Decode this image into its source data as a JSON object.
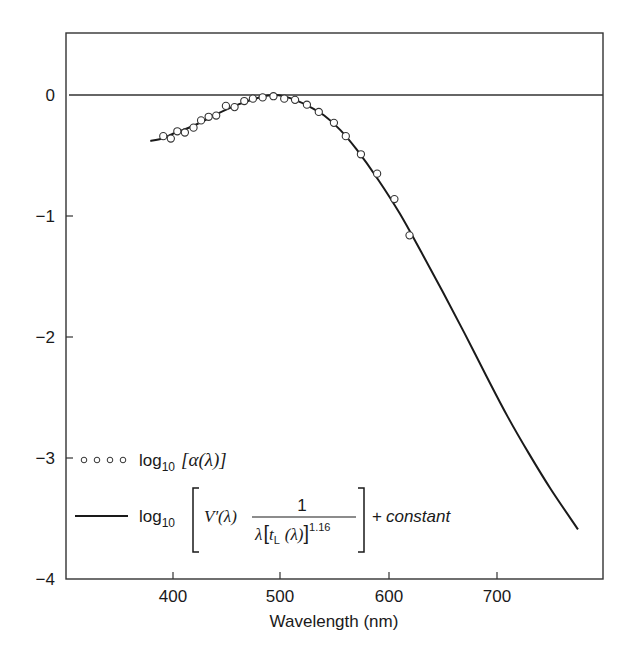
{
  "chart_data": {
    "type": "line",
    "title": "",
    "xlabel": "Wavelength (nm)",
    "ylabel": "",
    "xlim": [
      300,
      800
    ],
    "ylim": [
      -4,
      0.5
    ],
    "grid": false,
    "x_ticks": [
      400,
      500,
      600,
      700
    ],
    "y_ticks": [
      0,
      -1,
      -2,
      -3,
      -4
    ],
    "x_tick_labels": [
      "400",
      "500",
      "600",
      "700"
    ],
    "y_tick_labels": [
      "0",
      "−1",
      "−2",
      "−3",
      "−4"
    ],
    "reference_line": {
      "y": 0
    },
    "legend_position": "lower-left inside",
    "series": [
      {
        "name": "log10 [α(λ)]",
        "style": "open circles",
        "x": [
          391,
          398,
          404,
          411,
          419,
          426,
          433,
          440,
          449,
          457,
          466,
          474,
          483,
          493,
          503,
          513,
          524,
          535,
          549,
          560,
          574,
          589,
          605,
          619
        ],
        "y": [
          -0.34,
          -0.36,
          -0.3,
          -0.31,
          -0.27,
          -0.21,
          -0.18,
          -0.17,
          -0.09,
          -0.1,
          -0.05,
          -0.03,
          -0.02,
          -0.01,
          -0.03,
          -0.04,
          -0.08,
          -0.14,
          -0.23,
          -0.34,
          -0.49,
          -0.65,
          -0.86,
          -1.16
        ]
      },
      {
        "name": "log10 [V′(λ) · 1 / (λ[tL(λ)]^1.16)] + constant",
        "style": "solid line",
        "x": [
          379,
          390,
          400,
          420,
          440,
          460,
          480,
          495,
          510,
          525,
          540,
          555,
          570,
          590,
          610,
          630,
          650,
          670,
          690,
          710,
          730,
          750,
          775
        ],
        "y": [
          -0.38,
          -0.36,
          -0.32,
          -0.25,
          -0.16,
          -0.08,
          -0.02,
          0.0,
          -0.03,
          -0.09,
          -0.17,
          -0.29,
          -0.45,
          -0.7,
          -0.98,
          -1.3,
          -1.63,
          -1.97,
          -2.32,
          -2.66,
          -2.97,
          -3.26,
          -3.59
        ]
      }
    ]
  },
  "legend": {
    "series1": {
      "prefix": "log",
      "sub": "10",
      "body": "[α(λ)]"
    },
    "series2": {
      "prefix": "log",
      "sub": "10",
      "numerator": "1",
      "vprime": "V′(λ)",
      "den_lambda": "λ",
      "den_t": "t",
      "den_t_sub": "L",
      "den_arg": "(λ)",
      "exponent": "1.16",
      "suffix_plus": "+",
      "suffix_const": "constant"
    }
  },
  "axes": {
    "xlabel": "Wavelength (nm)",
    "x_ticks": [
      "400",
      "500",
      "600",
      "700"
    ],
    "y_ticks": [
      "0",
      "−1",
      "−2",
      "−3",
      "−4"
    ]
  }
}
